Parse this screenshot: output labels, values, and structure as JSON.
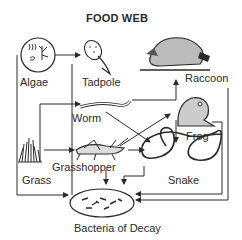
{
  "title": "FOOD WEB",
  "organisms": {
    "algae": {
      "label": "Algae"
    },
    "tadpole": {
      "label": "Tadpole"
    },
    "raccoon": {
      "label": "Raccoon"
    },
    "worm": {
      "label": "Worm"
    },
    "frog": {
      "label": "Frog"
    },
    "grass": {
      "label": "Grass"
    },
    "grasshopper": {
      "label": "Grasshopper"
    },
    "snake": {
      "label": "Snake"
    },
    "bacteria": {
      "label": "Bacteria of Decay"
    }
  },
  "relationships": [
    {
      "from": "Algae",
      "to": "Tadpole"
    },
    {
      "from": "Algae",
      "to": "Bacteria of Decay"
    },
    {
      "from": "Tadpole",
      "to": "Bacteria of Decay"
    },
    {
      "from": "Grass",
      "to": "Worm"
    },
    {
      "from": "Grass",
      "to": "Grasshopper"
    },
    {
      "from": "Grass",
      "to": "Bacteria of Decay"
    },
    {
      "from": "Worm",
      "to": "Snake"
    },
    {
      "from": "Grasshopper",
      "to": "Frog"
    },
    {
      "from": "Grasshopper",
      "to": "Snake"
    },
    {
      "from": "Grasshopper",
      "to": "Bacteria of Decay"
    },
    {
      "from": "Frog",
      "to": "Raccoon"
    },
    {
      "from": "Frog",
      "to": "Snake"
    },
    {
      "from": "Frog",
      "to": "Bacteria of Decay"
    },
    {
      "from": "Raccoon",
      "to": "Bacteria of Decay"
    },
    {
      "from": "Snake",
      "to": "Bacteria of Decay"
    }
  ],
  "colors": {
    "ink": "#2a2a2a",
    "background": "#ffffff"
  }
}
